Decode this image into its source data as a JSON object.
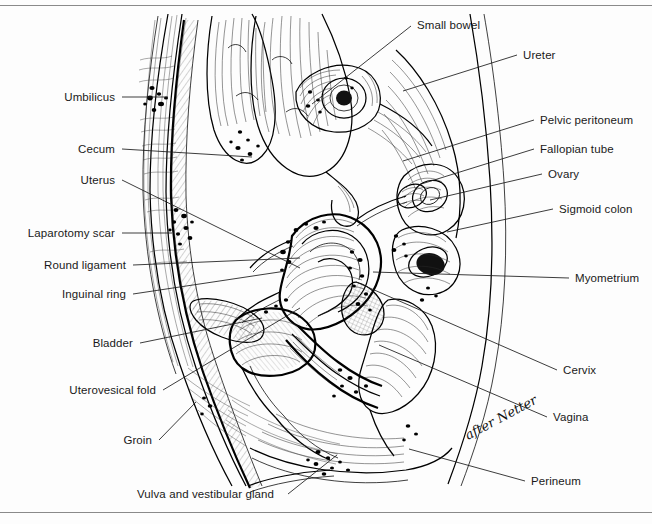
{
  "figure": {
    "signature": "after Netter",
    "ink_color": "#111111",
    "background_color": "#ffffff",
    "rule_color": "#8a8a8a"
  },
  "labels_left": [
    {
      "text": "Umbilicus",
      "x": 115,
      "y": 100,
      "lx1": 122,
      "ly1": 97,
      "lx2": 168,
      "ly2": 97
    },
    {
      "text": "Cecum",
      "x": 115,
      "y": 152,
      "lx1": 122,
      "ly1": 149,
      "lx2": 252,
      "ly2": 157
    },
    {
      "text": "Uterus",
      "x": 115,
      "y": 183,
      "lx1": 122,
      "ly1": 180,
      "lx2": 300,
      "ly2": 268
    },
    {
      "text": "Laparotomy scar",
      "x": 115,
      "y": 236,
      "lx1": 122,
      "ly1": 233,
      "lx2": 172,
      "ly2": 233
    },
    {
      "text": "Round ligament",
      "x": 126,
      "y": 268,
      "lx1": 133,
      "ly1": 265,
      "lx2": 300,
      "ly2": 258
    },
    {
      "text": "Inguinal ring",
      "x": 126,
      "y": 297,
      "lx1": 133,
      "ly1": 294,
      "lx2": 286,
      "ly2": 271
    },
    {
      "text": "Bladder",
      "x": 133,
      "y": 346,
      "lx1": 140,
      "ly1": 343,
      "lx2": 262,
      "ly2": 318
    },
    {
      "text": "Uterovesical fold",
      "x": 156,
      "y": 393,
      "lx1": 163,
      "ly1": 390,
      "lx2": 300,
      "ly2": 308
    },
    {
      "text": "Groin",
      "x": 152,
      "y": 443,
      "lx1": 159,
      "ly1": 440,
      "lx2": 196,
      "ly2": 402
    }
  ],
  "labels_right": [
    {
      "text": "Small bowel",
      "x": 417,
      "y": 28,
      "lx1": 411,
      "ly1": 26,
      "lx2": 312,
      "ly2": 104
    },
    {
      "text": "Ureter",
      "x": 523,
      "y": 58,
      "lx1": 517,
      "ly1": 55,
      "lx2": 403,
      "ly2": 91
    },
    {
      "text": "Pelvic peritoneum",
      "x": 540,
      "y": 123,
      "lx1": 534,
      "ly1": 120,
      "lx2": 403,
      "ly2": 161
    },
    {
      "text": "Fallopian tube",
      "x": 540,
      "y": 152,
      "lx1": 534,
      "ly1": 149,
      "lx2": 418,
      "ly2": 185
    },
    {
      "text": "Ovary",
      "x": 548,
      "y": 177,
      "lx1": 542,
      "ly1": 174,
      "lx2": 430,
      "ly2": 200
    },
    {
      "text": "Sigmoid colon",
      "x": 559,
      "y": 212,
      "lx1": 553,
      "ly1": 209,
      "lx2": 447,
      "ly2": 232
    },
    {
      "text": "Myometrium",
      "x": 575,
      "y": 281,
      "lx1": 569,
      "ly1": 278,
      "lx2": 373,
      "ly2": 272
    },
    {
      "text": "Cervix",
      "x": 563,
      "y": 373,
      "lx1": 557,
      "ly1": 370,
      "lx2": 356,
      "ly2": 282
    },
    {
      "text": "Vagina",
      "x": 553,
      "y": 420,
      "lx1": 547,
      "ly1": 417,
      "lx2": 379,
      "ly2": 345
    },
    {
      "text": "Perineum",
      "x": 531,
      "y": 484,
      "lx1": 525,
      "ly1": 481,
      "lx2": 409,
      "ly2": 449
    }
  ],
  "labels_bottom": [
    {
      "text": "Vulva and vestibular gland",
      "x": 137,
      "y": 497,
      "lx1": 288,
      "ly1": 494,
      "lx2": 337,
      "ly2": 455
    }
  ]
}
